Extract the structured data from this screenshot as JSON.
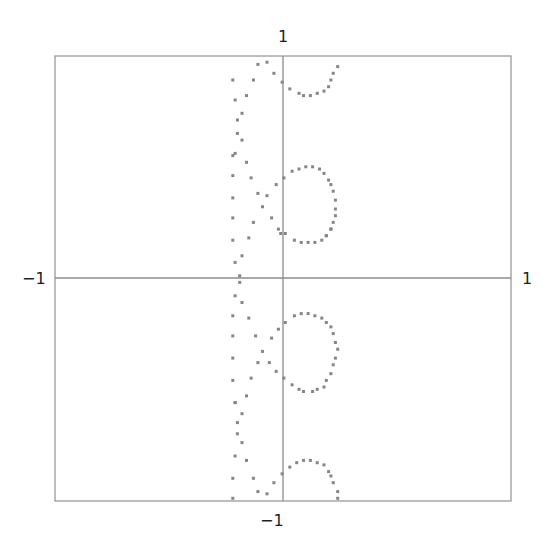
{
  "chart_data": {
    "type": "scatter",
    "title": "",
    "xlabel": "",
    "ylabel": "",
    "xlim": [
      -1,
      1
    ],
    "ylim": [
      -1,
      1
    ],
    "grid": false,
    "legend": null,
    "axes_through_origin": true,
    "tick_labels": {
      "x_min": "−1",
      "x_max": "1",
      "y_min": "−1",
      "y_max": "1"
    },
    "marker": {
      "shape": "square",
      "size": 3,
      "color": "#858585"
    },
    "series": [
      {
        "name": "points",
        "points": [
          [
            -0.11,
            0.96
          ],
          [
            -0.07,
            0.97
          ],
          [
            -0.22,
            0.89
          ],
          [
            -0.13,
            0.89
          ],
          [
            -0.04,
            0.92
          ],
          [
            -0.004,
            0.88
          ],
          [
            0.03,
            0.85
          ],
          [
            0.07,
            0.83
          ],
          [
            0.09,
            0.82
          ],
          [
            0.12,
            0.82
          ],
          [
            0.15,
            0.83
          ],
          [
            0.18,
            0.84
          ],
          [
            0.2,
            0.86
          ],
          [
            0.21,
            0.89
          ],
          [
            0.22,
            0.92
          ],
          [
            0.24,
            0.95
          ],
          [
            -0.21,
            0.8
          ],
          [
            -0.16,
            0.82
          ],
          [
            -0.18,
            0.74
          ],
          [
            -0.2,
            0.71
          ],
          [
            -0.2,
            0.65
          ],
          [
            -0.18,
            0.62
          ],
          [
            -0.21,
            0.56
          ],
          [
            -0.22,
            0.55
          ],
          [
            -0.16,
            0.52
          ],
          [
            -0.22,
            0.46
          ],
          [
            -0.14,
            0.45
          ],
          [
            0.004,
            0.45
          ],
          [
            0.04,
            0.48
          ],
          [
            0.07,
            0.49
          ],
          [
            0.1,
            0.5
          ],
          [
            0.13,
            0.5
          ],
          [
            0.16,
            0.49
          ],
          [
            0.18,
            0.47
          ],
          [
            0.2,
            0.44
          ],
          [
            0.21,
            0.42
          ],
          [
            0.22,
            0.39
          ],
          [
            0.23,
            0.35
          ],
          [
            0.23,
            0.31
          ],
          [
            0.23,
            0.28
          ],
          [
            0.22,
            0.25
          ],
          [
            0.21,
            0.22
          ],
          [
            0.19,
            0.19
          ],
          [
            -0.03,
            0.42
          ],
          [
            -0.11,
            0.38
          ],
          [
            -0.07,
            0.37
          ],
          [
            -0.22,
            0.36
          ],
          [
            -0.09,
            0.32
          ],
          [
            -0.22,
            0.27
          ],
          [
            -0.13,
            0.25
          ],
          [
            -0.05,
            0.27
          ],
          [
            -0.02,
            0.22
          ],
          [
            -0.15,
            0.18
          ],
          [
            -0.01,
            0.2
          ],
          [
            -0.22,
            0.17
          ],
          [
            0.01,
            0.2
          ],
          [
            0.05,
            0.17
          ],
          [
            0.08,
            0.16
          ],
          [
            0.11,
            0.16
          ],
          [
            0.14,
            0.16
          ],
          [
            0.17,
            0.17
          ],
          [
            0.19,
            0.19
          ],
          [
            0.21,
            0.22
          ],
          [
            -0.18,
            0.1
          ],
          [
            -0.21,
            0.07
          ],
          [
            -0.19,
            0.01
          ],
          [
            -0.19,
            -0.02
          ],
          [
            -0.21,
            -0.08
          ],
          [
            -0.18,
            -0.11
          ],
          [
            -0.22,
            -0.17
          ],
          [
            -0.15,
            -0.18
          ],
          [
            0.01,
            -0.2
          ],
          [
            0.05,
            -0.17
          ],
          [
            0.08,
            -0.16
          ],
          [
            0.11,
            -0.16
          ],
          [
            0.14,
            -0.17
          ],
          [
            0.17,
            -0.18
          ],
          [
            0.19,
            -0.2
          ],
          [
            0.21,
            -0.22
          ],
          [
            0.22,
            -0.25
          ],
          [
            0.23,
            -0.29
          ],
          [
            0.24,
            -0.32
          ],
          [
            0.23,
            -0.36
          ],
          [
            0.22,
            -0.39
          ],
          [
            0.21,
            -0.43
          ],
          [
            0.19,
            -0.46
          ],
          [
            0.18,
            -0.49
          ],
          [
            0.15,
            -0.5
          ],
          [
            0.13,
            -0.51
          ],
          [
            0.09,
            -0.51
          ],
          [
            0.07,
            -0.5
          ],
          [
            0.04,
            -0.48
          ],
          [
            0.004,
            -0.45
          ],
          [
            -0.02,
            -0.23
          ],
          [
            -0.05,
            -0.27
          ],
          [
            -0.12,
            -0.26
          ],
          [
            -0.22,
            -0.26
          ],
          [
            -0.09,
            -0.33
          ],
          [
            -0.22,
            -0.36
          ],
          [
            -0.11,
            -0.38
          ],
          [
            -0.06,
            -0.38
          ],
          [
            -0.03,
            -0.42
          ],
          [
            -0.22,
            -0.46
          ],
          [
            -0.14,
            -0.45
          ],
          [
            -0.16,
            -0.53
          ],
          [
            -0.21,
            -0.56
          ],
          [
            -0.21,
            -0.56
          ],
          [
            -0.18,
            -0.61
          ],
          [
            -0.2,
            -0.65
          ],
          [
            -0.2,
            -0.7
          ],
          [
            -0.18,
            -0.74
          ],
          [
            -0.21,
            -0.8
          ],
          [
            -0.16,
            -0.82
          ],
          [
            -0.22,
            -0.9
          ],
          [
            -0.13,
            -0.9
          ],
          [
            -0.004,
            -0.88
          ],
          [
            0.03,
            -0.85
          ],
          [
            0.06,
            -0.83
          ],
          [
            0.09,
            -0.82
          ],
          [
            0.12,
            -0.82
          ],
          [
            0.15,
            -0.83
          ],
          [
            0.18,
            -0.84
          ],
          [
            0.2,
            -0.87
          ],
          [
            0.21,
            -0.89
          ],
          [
            0.22,
            -0.92
          ],
          [
            0.24,
            -0.96
          ],
          [
            0.24,
            -0.99
          ],
          [
            -0.04,
            -0.92
          ],
          [
            -0.11,
            -0.96
          ],
          [
            -0.07,
            -0.97
          ],
          [
            -0.22,
            -0.99
          ]
        ]
      }
    ]
  }
}
